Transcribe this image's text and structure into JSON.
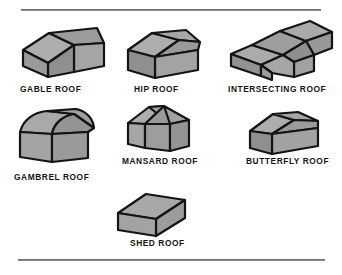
{
  "figure": {
    "background_color": "#ffffff",
    "rule_color": "#8c8c8c",
    "roof_fill_color": "#a0a0a0",
    "roof_fill_light": "#b4b4b4",
    "roof_fill_dark": "#8f8f8f",
    "roof_outline_color": "#141414",
    "label_color": "#151515"
  },
  "rules": {
    "top_label": "top-divider-rule",
    "bottom_label": "bottom-divider-rule"
  },
  "roofs": [
    {
      "id": "gable",
      "label": "GABLE ROOF"
    },
    {
      "id": "hip",
      "label": "HIP ROOF"
    },
    {
      "id": "intersecting",
      "label": "INTERSECTING ROOF"
    },
    {
      "id": "gambrel",
      "label": "GAMBREL ROOF"
    },
    {
      "id": "mansard",
      "label": "MANSARD ROOF"
    },
    {
      "id": "butterfly",
      "label": "BUTTERFLY ROOF"
    },
    {
      "id": "shed",
      "label": "SHED ROOF"
    }
  ]
}
